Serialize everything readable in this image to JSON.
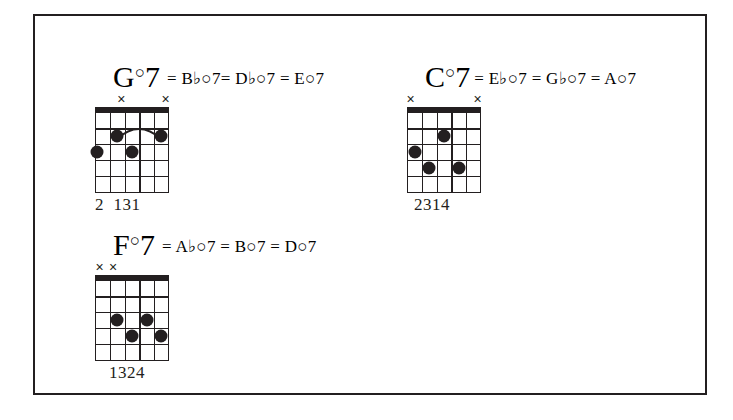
{
  "document": {
    "title": "Diminished 7th Chord Voicings",
    "background_color": "#ffffff",
    "ink_color": "#231f20",
    "border_color": "#231f20"
  },
  "chords": [
    {
      "id": "g-dim7",
      "root": "G",
      "degree_symbol": "○",
      "seventh": "7",
      "equivalents_text": "= B♭○7= D♭○7 = E○7",
      "equivalents": [
        {
          "root": "B",
          "accidental": "♭",
          "degree": "○",
          "seventh": "7"
        },
        {
          "root": "D",
          "accidental": "♭",
          "degree": "○",
          "seventh": "7"
        },
        {
          "root": "E",
          "accidental": "",
          "degree": "○",
          "seventh": "7"
        }
      ],
      "fingering": "2  131",
      "strings": 6,
      "frets": 5,
      "muted_strings": [
        2,
        5
      ],
      "dots": [
        {
          "string": 5,
          "fret": 3
        },
        {
          "string": 4,
          "fret": 2
        },
        {
          "string": 3,
          "fret": 2
        },
        {
          "string": 2,
          "fret": 3
        }
      ],
      "barre": {
        "fret": 2,
        "from_string": 4,
        "to_string": 2
      }
    },
    {
      "id": "c-dim7",
      "root": "C",
      "degree_symbol": "○",
      "seventh": "7",
      "equivalents_text": "= E♭○7 = G♭○7 = A○7",
      "equivalents": [
        {
          "root": "E",
          "accidental": "♭",
          "degree": "○",
          "seventh": "7"
        },
        {
          "root": "G",
          "accidental": "♭",
          "degree": "○",
          "seventh": "7"
        },
        {
          "root": "A",
          "accidental": "",
          "degree": "○",
          "seventh": "7"
        }
      ],
      "fingering": "2314",
      "strings": 6,
      "frets": 5,
      "muted_strings": [
        1,
        6
      ],
      "dots": [
        {
          "string": 5,
          "fret": 3
        },
        {
          "string": 4,
          "fret": 4
        },
        {
          "string": 3,
          "fret": 2
        },
        {
          "string": 2,
          "fret": 4
        }
      ],
      "barre": null
    },
    {
      "id": "f-dim7",
      "root": "F",
      "degree_symbol": "○",
      "seventh": "7",
      "equivalents_text": "= A♭○7 = B○7 =  D○7",
      "equivalents": [
        {
          "root": "A",
          "accidental": "♭",
          "degree": "○",
          "seventh": "7"
        },
        {
          "root": "B",
          "accidental": "",
          "degree": "○",
          "seventh": "7"
        },
        {
          "root": "D",
          "accidental": "",
          "degree": "○",
          "seventh": "7"
        }
      ],
      "fingering": "1324",
      "strings": 6,
      "frets": 5,
      "muted_strings": [
        5,
        6
      ],
      "dots": [
        {
          "string": 4,
          "fret": 3
        },
        {
          "string": 3,
          "fret": 4
        },
        {
          "string": 2,
          "fret": 3
        },
        {
          "string": 1,
          "fret": 4
        }
      ],
      "barre": null
    }
  ]
}
